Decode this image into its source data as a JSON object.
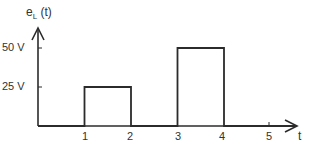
{
  "chart_data": {
    "type": "line",
    "title": "",
    "xlabel": "t",
    "ylabel": "e_L (t)",
    "ylabel_main": "e",
    "ylabel_sub": "L",
    "ylabel_arg": " (t)",
    "x_ticks": [
      "1",
      "2",
      "3",
      "4",
      "5"
    ],
    "y_ticks": [
      "25 V",
      "50 V"
    ],
    "xlim": [
      0,
      5.6
    ],
    "ylim": [
      0,
      60
    ],
    "grid": false,
    "legend": null,
    "series": [
      {
        "name": "e_L(t)",
        "x": [
          0,
          1,
          1,
          2,
          2,
          3,
          3,
          4,
          4,
          5.5
        ],
        "y": [
          0,
          0,
          25,
          25,
          0,
          0,
          50,
          50,
          0,
          0
        ]
      }
    ],
    "pulses": [
      {
        "t_start": 1,
        "t_end": 2,
        "value": 25,
        "unit": "V"
      },
      {
        "t_start": 3,
        "t_end": 4,
        "value": 50,
        "unit": "V"
      }
    ],
    "line_color": "#2b2b2b"
  }
}
